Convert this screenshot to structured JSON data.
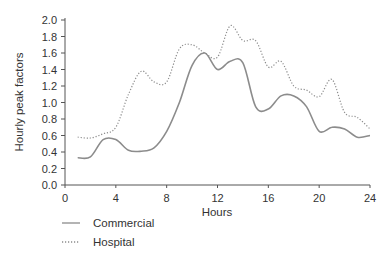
{
  "chart_data": {
    "type": "line",
    "title": "",
    "xlabel": "Hours",
    "ylabel": "Hourly peak factors",
    "xlim": [
      0,
      24
    ],
    "ylim": [
      0.0,
      2.0
    ],
    "x_ticks": [
      0,
      4,
      8,
      12,
      16,
      20,
      24
    ],
    "y_ticks": [
      "0.0",
      "0.2",
      "0.4",
      "0.6",
      "0.8",
      "1.0",
      "1.2",
      "1.4",
      "1.6",
      "1.8",
      "2.0"
    ],
    "grid": false,
    "legend_position": "bottom-left",
    "x": [
      1,
      2,
      3,
      4,
      5,
      6,
      7,
      8,
      9,
      10,
      11,
      12,
      13,
      14,
      15,
      16,
      17,
      18,
      19,
      20,
      21,
      22,
      23,
      24
    ],
    "series": [
      {
        "name": "Commercial",
        "style": "solid",
        "color": "#8c8c8c",
        "values": [
          0.33,
          0.34,
          0.55,
          0.55,
          0.42,
          0.41,
          0.45,
          0.65,
          1.0,
          1.45,
          1.6,
          1.4,
          1.5,
          1.48,
          0.95,
          0.92,
          1.08,
          1.08,
          0.95,
          0.65,
          0.7,
          0.68,
          0.58,
          0.6
        ]
      },
      {
        "name": "Hospital",
        "style": "dotted",
        "color": "#8c8c8c",
        "values": [
          0.58,
          0.57,
          0.62,
          0.7,
          1.1,
          1.38,
          1.25,
          1.25,
          1.65,
          1.7,
          1.6,
          1.55,
          1.93,
          1.75,
          1.75,
          1.43,
          1.5,
          1.2,
          1.15,
          1.07,
          1.28,
          0.88,
          0.82,
          0.68
        ]
      }
    ]
  },
  "legend": {
    "items": [
      {
        "label": "Commercial"
      },
      {
        "label": "Hospital"
      }
    ]
  }
}
